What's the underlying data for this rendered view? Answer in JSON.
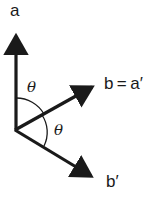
{
  "diagram": {
    "type": "vector-angle-diagram",
    "colors": {
      "stroke": "#1a1a1a",
      "background": "#ffffff"
    },
    "vectors": [
      {
        "id": "a",
        "label": "a",
        "from": [
          16,
          130
        ],
        "to": [
          16,
          28
        ]
      },
      {
        "id": "b",
        "label": "b = a′",
        "from": [
          16,
          130
        ],
        "to": [
          99,
          83
        ]
      },
      {
        "id": "b_prime",
        "label": "b′",
        "from": [
          16,
          130
        ],
        "to": [
          98,
          180
        ]
      }
    ],
    "labels": {
      "a": "a",
      "b": "b = a′",
      "b_prime": "b′",
      "theta_upper": "θ",
      "theta_lower": "θ"
    },
    "angles": [
      {
        "name": "theta-upper",
        "between": [
          "a",
          "b"
        ],
        "label": "θ"
      },
      {
        "name": "theta-lower",
        "between": [
          "b",
          "b_prime"
        ],
        "label": "θ"
      }
    ]
  }
}
